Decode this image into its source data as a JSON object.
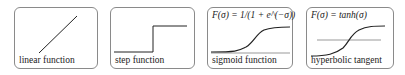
{
  "panels": [
    {
      "id": "linear",
      "caption": "linear function",
      "formula": null
    },
    {
      "id": "step",
      "caption": "step function",
      "formula": null
    },
    {
      "id": "sigmoid",
      "caption": "sigmoid function",
      "formula": "F(σ) = 1/(1 + e⁻ᵠ)"
    },
    {
      "id": "tanh",
      "caption": "hyperbolic tangent",
      "formula": "F(σ) = tanh(σ)"
    }
  ],
  "sigmoid_formula_display": "F(σ) = 1/(1 + e^(−σ))",
  "colors": {
    "border": "#8a8a8a",
    "curve": "#222222",
    "axis": "#555555"
  }
}
